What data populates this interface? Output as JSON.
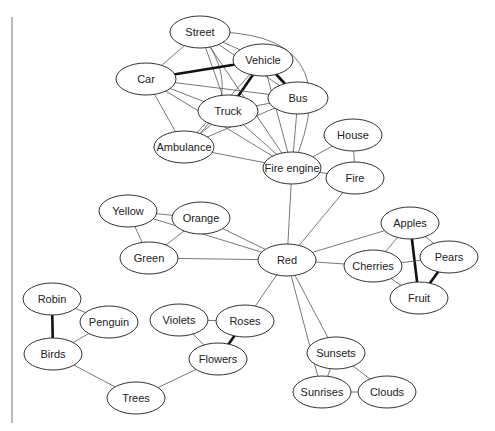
{
  "diagram": {
    "type": "semantic-network",
    "nodes": [
      {
        "id": "street",
        "label": "Street",
        "x": 200,
        "y": 32,
        "rx": 30,
        "ry": 16
      },
      {
        "id": "vehicle",
        "label": "Vehicle",
        "x": 263,
        "y": 60,
        "rx": 30,
        "ry": 16
      },
      {
        "id": "car",
        "label": "Car",
        "x": 146,
        "y": 79,
        "rx": 30,
        "ry": 16
      },
      {
        "id": "bus",
        "label": "Bus",
        "x": 298,
        "y": 98,
        "rx": 30,
        "ry": 16
      },
      {
        "id": "truck",
        "label": "Truck",
        "x": 228,
        "y": 111,
        "rx": 30,
        "ry": 16
      },
      {
        "id": "ambulance",
        "label": "Ambulance",
        "x": 184,
        "y": 147,
        "rx": 30,
        "ry": 16
      },
      {
        "id": "fire_engine",
        "label": "Fire engine",
        "x": 292,
        "y": 168,
        "rx": 29,
        "ry": 16
      },
      {
        "id": "house",
        "label": "House",
        "x": 353,
        "y": 135,
        "rx": 29,
        "ry": 16
      },
      {
        "id": "fire",
        "label": "Fire",
        "x": 355,
        "y": 178,
        "rx": 29,
        "ry": 16
      },
      {
        "id": "yellow",
        "label": "Yellow",
        "x": 128,
        "y": 211,
        "rx": 29,
        "ry": 16
      },
      {
        "id": "orange",
        "label": "Orange",
        "x": 201,
        "y": 218,
        "rx": 29,
        "ry": 16
      },
      {
        "id": "green",
        "label": "Green",
        "x": 149,
        "y": 258,
        "rx": 29,
        "ry": 16
      },
      {
        "id": "red",
        "label": "Red",
        "x": 287,
        "y": 260,
        "rx": 29,
        "ry": 16
      },
      {
        "id": "apples",
        "label": "Apples",
        "x": 410,
        "y": 223,
        "rx": 29,
        "ry": 16
      },
      {
        "id": "cherries",
        "label": "Cherries",
        "x": 373,
        "y": 266,
        "rx": 29,
        "ry": 16
      },
      {
        "id": "pears",
        "label": "Pears",
        "x": 449,
        "y": 257,
        "rx": 29,
        "ry": 16
      },
      {
        "id": "fruit",
        "label": "Fruit",
        "x": 419,
        "y": 298,
        "rx": 29,
        "ry": 16
      },
      {
        "id": "robin",
        "label": "Robin",
        "x": 52,
        "y": 299,
        "rx": 29,
        "ry": 16
      },
      {
        "id": "penguin",
        "label": "Penguin",
        "x": 109,
        "y": 322,
        "rx": 29,
        "ry": 16
      },
      {
        "id": "birds",
        "label": "Birds",
        "x": 53,
        "y": 354,
        "rx": 29,
        "ry": 16
      },
      {
        "id": "violets",
        "label": "Violets",
        "x": 179,
        "y": 320,
        "rx": 29,
        "ry": 16
      },
      {
        "id": "roses",
        "label": "Roses",
        "x": 245,
        "y": 321,
        "rx": 29,
        "ry": 16
      },
      {
        "id": "flowers",
        "label": "Flowers",
        "x": 218,
        "y": 359,
        "rx": 29,
        "ry": 16
      },
      {
        "id": "trees",
        "label": "Trees",
        "x": 136,
        "y": 398,
        "rx": 29,
        "ry": 16
      },
      {
        "id": "sunsets",
        "label": "Sunsets",
        "x": 336,
        "y": 353,
        "rx": 29,
        "ry": 16
      },
      {
        "id": "sunrises",
        "label": "Sunrises",
        "x": 322,
        "y": 392,
        "rx": 29,
        "ry": 16
      },
      {
        "id": "clouds",
        "label": "Clouds",
        "x": 387,
        "y": 392,
        "rx": 29,
        "ry": 16
      }
    ],
    "edges": [
      {
        "from": "street",
        "to": "vehicle",
        "strong": false
      },
      {
        "from": "street",
        "to": "car",
        "strong": false
      },
      {
        "from": "street",
        "to": "truck",
        "strong": false
      },
      {
        "from": "street",
        "to": "bus",
        "strong": false
      },
      {
        "from": "street",
        "to": "ambulance",
        "strong": false,
        "curve": -60
      },
      {
        "from": "street",
        "to": "fire_engine",
        "strong": false,
        "curve": -130
      },
      {
        "from": "street",
        "to": "fire_engine",
        "strong": false,
        "curve": 0
      },
      {
        "from": "car",
        "to": "vehicle",
        "strong": true
      },
      {
        "from": "vehicle",
        "to": "truck",
        "strong": true
      },
      {
        "from": "vehicle",
        "to": "bus",
        "strong": true
      },
      {
        "from": "vehicle",
        "to": "ambulance",
        "strong": false
      },
      {
        "from": "vehicle",
        "to": "fire_engine",
        "strong": false
      },
      {
        "from": "car",
        "to": "bus",
        "strong": false
      },
      {
        "from": "car",
        "to": "truck",
        "strong": false
      },
      {
        "from": "car",
        "to": "ambulance",
        "strong": false
      },
      {
        "from": "car",
        "to": "fire_engine",
        "strong": false
      },
      {
        "from": "truck",
        "to": "bus",
        "strong": false
      },
      {
        "from": "truck",
        "to": "ambulance",
        "strong": false
      },
      {
        "from": "truck",
        "to": "fire_engine",
        "strong": false
      },
      {
        "from": "bus",
        "to": "ambulance",
        "strong": false
      },
      {
        "from": "bus",
        "to": "fire_engine",
        "strong": false
      },
      {
        "from": "ambulance",
        "to": "fire_engine",
        "strong": false
      },
      {
        "from": "fire_engine",
        "to": "house",
        "strong": false
      },
      {
        "from": "fire_engine",
        "to": "fire",
        "strong": false
      },
      {
        "from": "house",
        "to": "fire",
        "strong": false
      },
      {
        "from": "fire_engine",
        "to": "red",
        "strong": false
      },
      {
        "from": "fire",
        "to": "red",
        "strong": false
      },
      {
        "from": "yellow",
        "to": "orange",
        "strong": false
      },
      {
        "from": "yellow",
        "to": "green",
        "strong": false
      },
      {
        "from": "yellow",
        "to": "red",
        "strong": false
      },
      {
        "from": "orange",
        "to": "green",
        "strong": false
      },
      {
        "from": "orange",
        "to": "red",
        "strong": false
      },
      {
        "from": "green",
        "to": "red",
        "strong": false
      },
      {
        "from": "red",
        "to": "apples",
        "strong": false
      },
      {
        "from": "red",
        "to": "cherries",
        "strong": false
      },
      {
        "from": "red",
        "to": "roses",
        "strong": false
      },
      {
        "from": "red",
        "to": "sunsets",
        "strong": false
      },
      {
        "from": "red",
        "to": "sunrises",
        "strong": false
      },
      {
        "from": "apples",
        "to": "cherries",
        "strong": false
      },
      {
        "from": "apples",
        "to": "pears",
        "strong": false
      },
      {
        "from": "apples",
        "to": "fruit",
        "strong": true
      },
      {
        "from": "cherries",
        "to": "pears",
        "strong": false
      },
      {
        "from": "cherries",
        "to": "fruit",
        "strong": false
      },
      {
        "from": "pears",
        "to": "fruit",
        "strong": true
      },
      {
        "from": "robin",
        "to": "penguin",
        "strong": false
      },
      {
        "from": "robin",
        "to": "birds",
        "strong": true
      },
      {
        "from": "penguin",
        "to": "birds",
        "strong": false
      },
      {
        "from": "birds",
        "to": "trees",
        "strong": false
      },
      {
        "from": "violets",
        "to": "roses",
        "strong": false
      },
      {
        "from": "violets",
        "to": "flowers",
        "strong": false
      },
      {
        "from": "roses",
        "to": "flowers",
        "strong": true
      },
      {
        "from": "flowers",
        "to": "trees",
        "strong": false
      },
      {
        "from": "sunsets",
        "to": "sunrises",
        "strong": false
      },
      {
        "from": "sunsets",
        "to": "clouds",
        "strong": false
      },
      {
        "from": "sunrises",
        "to": "clouds",
        "strong": false
      }
    ]
  }
}
